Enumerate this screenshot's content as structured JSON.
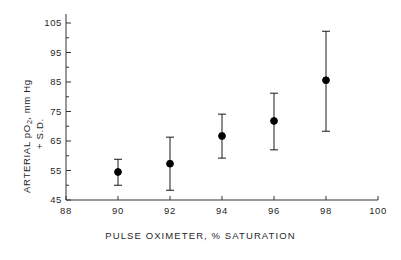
{
  "chart_data": {
    "type": "scatter",
    "title": "",
    "xlabel": "PULSE OXIMETER, % SATURATION",
    "ylabel_line1": "ARTERIAL pO",
    "ylabel_sub": "2",
    "ylabel_line1_tail": ", mm Hg",
    "ylabel_line2": "+ S.D.",
    "ylabel_full": "ARTERIAL pO2, mm Hg + S.D.",
    "xlim": [
      88,
      100
    ],
    "ylim": [
      45,
      105
    ],
    "xticks": [
      88,
      90,
      92,
      94,
      96,
      98,
      100
    ],
    "xtick_labels": [
      "88",
      "90",
      "92",
      "94",
      "96",
      "98",
      "100"
    ],
    "yticks": [
      45,
      55,
      65,
      75,
      85,
      95,
      105
    ],
    "ytick_labels": [
      "45",
      "55",
      "65",
      "75",
      "85",
      "95",
      "105"
    ],
    "y_minor_ticks": [
      50,
      60,
      70,
      80,
      90,
      100
    ],
    "grid": false,
    "legend": null,
    "marker": "filled-circle",
    "error_bar_style": "plus-minus-1sd-capped",
    "x": [
      90,
      92,
      94,
      96,
      98
    ],
    "values": [
      54.5,
      57.3,
      66.7,
      71.8,
      85.6
    ],
    "err_low": [
      50.0,
      48.3,
      59.2,
      62.0,
      68.3
    ],
    "err_high": [
      58.8,
      66.3,
      74.1,
      81.2,
      102.2
    ],
    "points": [
      {
        "x": 90,
        "y": 54.5,
        "low": 50.0,
        "high": 58.8
      },
      {
        "x": 92,
        "y": 57.3,
        "low": 48.3,
        "high": 66.3
      },
      {
        "x": 94,
        "y": 66.7,
        "low": 59.2,
        "high": 74.1
      },
      {
        "x": 96,
        "y": 71.8,
        "low": 62.0,
        "high": 81.2
      },
      {
        "x": 98,
        "y": 85.6,
        "low": 68.3,
        "high": 102.2
      }
    ],
    "colors": {
      "marker": "#000000",
      "error_bar": "#1a1a1a",
      "axis": "#333333",
      "text": "#1f1f1f",
      "background": "#ffffff"
    }
  }
}
